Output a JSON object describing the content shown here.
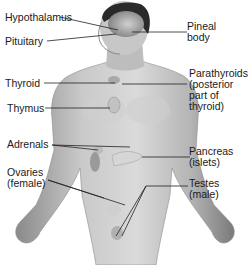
{
  "diagram": {
    "labels_left": [
      {
        "id": "hypothalamus",
        "lines": [
          "Hypothalamus"
        ]
      },
      {
        "id": "pituitary",
        "lines": [
          "Pituitary"
        ]
      },
      {
        "id": "thyroid",
        "lines": [
          "Thyroid"
        ]
      },
      {
        "id": "thymus",
        "lines": [
          "Thymus"
        ]
      },
      {
        "id": "adrenals",
        "lines": [
          "Adrenals"
        ]
      },
      {
        "id": "ovaries",
        "lines": [
          "Ovaries",
          "(female)"
        ]
      }
    ],
    "labels_right": [
      {
        "id": "pineal",
        "lines": [
          "Pineal",
          "body"
        ]
      },
      {
        "id": "parathyroids",
        "lines": [
          "Parathyroids",
          "(posterior",
          "part of",
          "thyroid)"
        ]
      },
      {
        "id": "pancreas",
        "lines": [
          "Pancreas",
          "(islets)"
        ]
      },
      {
        "id": "testes",
        "lines": [
          "Testes",
          "(male)"
        ]
      }
    ],
    "colors": {
      "background": "#ffffff",
      "label_text": "#1a1a1a",
      "leader_line": "#222222",
      "skin_light": "#d9d9d9",
      "skin_mid": "#a8a8a8",
      "skin_dark": "#6e6e6e",
      "hair": "#2a2a2a",
      "gland": "#c8c8c8"
    }
  }
}
